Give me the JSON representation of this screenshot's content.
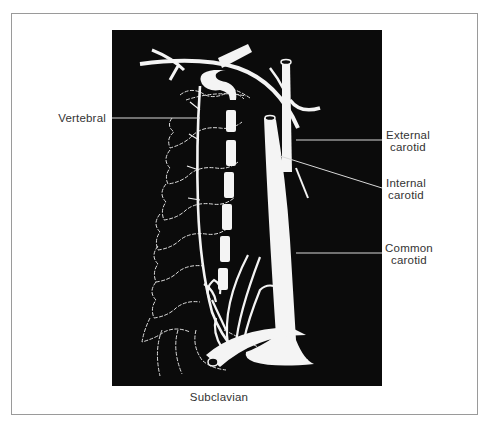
{
  "figure": {
    "labels": {
      "vertebral": "Vertebral",
      "external_carotid": [
        "External",
        "carotid"
      ],
      "internal_carotid": [
        "Internal",
        "carotid"
      ],
      "common_carotid": [
        "Common",
        "carotid"
      ],
      "subclavian": "Subclavian"
    },
    "colors": {
      "background": "#0b0b0b",
      "vessel": "#f4f4f4",
      "frame": "#9a9a9a",
      "text": "#333333"
    }
  }
}
